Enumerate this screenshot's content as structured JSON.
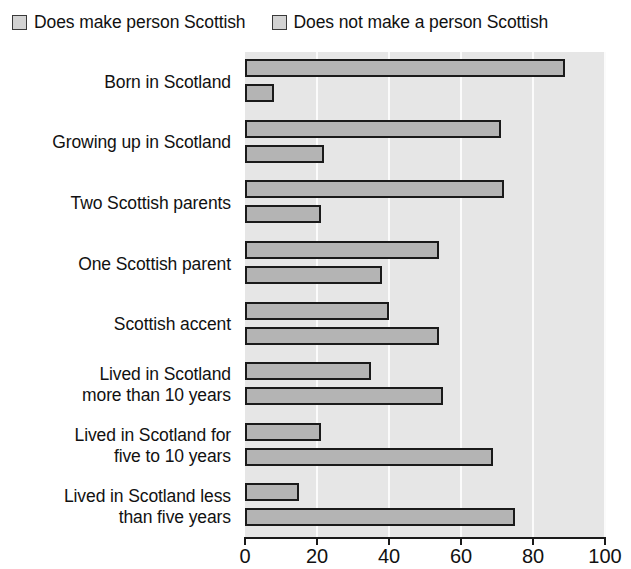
{
  "legend": {
    "position": "top-left",
    "entries": [
      {
        "label": "Does make person Scottish",
        "swatch_color": "#d3d3d3",
        "swatch_name": "legend-swatch-does-make"
      },
      {
        "label": "Does not make a person Scottish",
        "swatch_color": "#d3d3d3",
        "swatch_name": "legend-swatch-does-not-make"
      }
    ]
  },
  "axis": {
    "x_ticks": [
      "0",
      "20",
      "40",
      "60",
      "80",
      "100"
    ],
    "x_min": 0,
    "x_max": 100
  },
  "colors": {
    "bar_fill": "#b4b4b4",
    "bar_border": "#1a1a1a",
    "plot_background": "#e6e6e6",
    "gridline": "#fbfbfb",
    "text": "#111111"
  },
  "categories": [
    {
      "lines": [
        "Born in Scotland"
      ]
    },
    {
      "lines": [
        "Growing up in Scotland"
      ]
    },
    {
      "lines": [
        "Two Scottish parents"
      ]
    },
    {
      "lines": [
        "One Scottish parent"
      ]
    },
    {
      "lines": [
        "Scottish accent"
      ]
    },
    {
      "lines": [
        "Lived in Scotland",
        "more than 10 years"
      ]
    },
    {
      "lines": [
        "Lived in Scotland for",
        "five to 10 years"
      ]
    },
    {
      "lines": [
        "Lived in Scotland less",
        "than five years"
      ]
    }
  ],
  "chart_data": {
    "type": "bar",
    "orientation": "horizontal",
    "title": "",
    "xlabel": "",
    "ylabel": "",
    "xlim": [
      0,
      100
    ],
    "xticks": [
      0,
      20,
      40,
      60,
      80,
      100
    ],
    "grid": true,
    "grid_axis": "x",
    "legend_position": "top-left",
    "categories": [
      "Born in Scotland",
      "Growing up in Scotland",
      "Two Scottish parents",
      "One Scottish parent",
      "Scottish accent",
      "Lived in Scotland more than 10 years",
      "Lived in Scotland for five to 10 years",
      "Lived in Scotland less than five years"
    ],
    "series": [
      {
        "name": "Does make person Scottish",
        "color": "#b4b4b4",
        "values": [
          89,
          71,
          72,
          54,
          40,
          35,
          21,
          15
        ]
      },
      {
        "name": "Does not make a person Scottish",
        "color": "#b4b4b4",
        "values": [
          8,
          22,
          21,
          38,
          54,
          55,
          69,
          75
        ]
      }
    ]
  }
}
